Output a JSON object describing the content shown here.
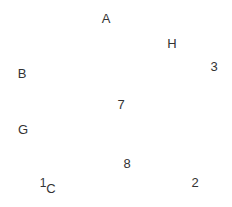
{
  "canvas": {
    "width": 232,
    "height": 207,
    "background": "#ffffff",
    "text_color": "#333333"
  },
  "labels": [
    {
      "id": "A",
      "text": "A",
      "x": 106,
      "y": 18
    },
    {
      "id": "H",
      "text": "H",
      "x": 172,
      "y": 43
    },
    {
      "id": "3",
      "text": "3",
      "x": 214,
      "y": 66
    },
    {
      "id": "B",
      "text": "B",
      "x": 22,
      "y": 73
    },
    {
      "id": "7",
      "text": "7",
      "x": 121,
      "y": 104
    },
    {
      "id": "G",
      "text": "G",
      "x": 23,
      "y": 129
    },
    {
      "id": "8",
      "text": "8",
      "x": 127,
      "y": 163
    },
    {
      "id": "1",
      "text": "1",
      "x": 43,
      "y": 183
    },
    {
      "id": "C",
      "text": "C",
      "x": 51,
      "y": 188
    },
    {
      "id": "2",
      "text": "2",
      "x": 195,
      "y": 182
    }
  ]
}
